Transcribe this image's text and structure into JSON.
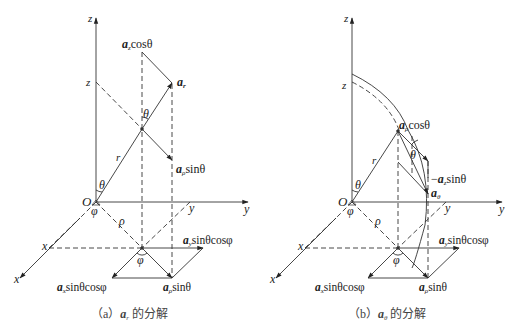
{
  "figure": {
    "panel_a": {
      "caption_prefix": "（a）",
      "caption_vec": "a",
      "caption_sub": "r",
      "caption_suffix": " 的分解",
      "labels": {
        "z_axis": "z",
        "z_mark": "z",
        "origin": "O",
        "y_axis": "y",
        "y_mark": "y",
        "x_axis": "x",
        "x_mark": "x",
        "r": "r",
        "rho": "ρ",
        "theta_top": "θ",
        "theta_origin": "θ",
        "phi_origin": "φ",
        "phi_ground": "φ",
        "az_cos": {
          "vec": "a",
          "sub": "z",
          "rest": "cosθ"
        },
        "ar": {
          "vec": "a",
          "sub": "r"
        },
        "arho_sin_upper": {
          "vec": "a",
          "sub": "ρ",
          "rest": "sinθ"
        },
        "ay": {
          "vec": "a",
          "sub": "y",
          "rest": "sinθcosφ"
        },
        "ax": {
          "vec": "a",
          "sub": "x",
          "rest": "sinθcosφ"
        },
        "arho_sin_lower": {
          "vec": "a",
          "sub": "ρ",
          "rest": "sinθ"
        }
      }
    },
    "panel_b": {
      "caption_prefix": "（b）",
      "caption_vec": "a",
      "caption_sub": "θ",
      "caption_suffix": " 的分解",
      "labels": {
        "z_axis": "z",
        "z_mark": "z",
        "origin": "O",
        "y_axis": "y",
        "y_mark": "y",
        "x_axis": "x",
        "x_mark": "x",
        "r": "r",
        "rho": "ρ",
        "theta_mid": "θ",
        "theta_origin": "θ",
        "phi_origin": "φ",
        "phi_ground": "φ",
        "arho_cos": {
          "vec": "a",
          "sub": "ρ",
          "rest": "cosθ"
        },
        "neg_az_sin": {
          "prefix": "−",
          "vec": "a",
          "sub": "z",
          "rest": "sinθ"
        },
        "atheta": {
          "vec": "a",
          "sub": "θ"
        },
        "ay": {
          "vec": "a",
          "sub": "y",
          "rest": "sinθcosφ"
        },
        "ax": {
          "vec": "a",
          "sub": "x",
          "rest": "sinθcosφ"
        },
        "arho_sin": {
          "vec": "a",
          "sub": "ρ",
          "rest": "sinθ"
        }
      }
    }
  }
}
